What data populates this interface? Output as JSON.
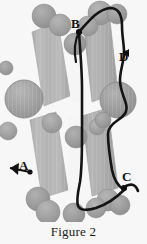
{
  "figure": {
    "caption": "Figure 2",
    "labels": [
      {
        "id": "A",
        "text": "A",
        "marker": "left-arrow-with-dot"
      },
      {
        "id": "B",
        "text": "B",
        "marker": "dot"
      },
      {
        "id": "C",
        "text": "C",
        "marker": "dot-with-tail"
      },
      {
        "id": "D",
        "text": "D",
        "marker": "dot-with-tail"
      }
    ],
    "colors": {
      "background": "#f7f7f7",
      "sheet_fill": "#b4b4b4",
      "sheet_fill_dark": "#a6a6a6",
      "sphere_fill": "#9b9b9b",
      "sphere_edge": "#8a8a8a",
      "connector_line": "#fafafa",
      "trace": "#141414",
      "text": "#121212"
    },
    "elements": {
      "sheets_label": "beta-sheet ribbons",
      "spheres_label": "atom spheres",
      "trace_label": "highlighted backbone loop",
      "connectors_label": "thin bond connectors"
    }
  }
}
